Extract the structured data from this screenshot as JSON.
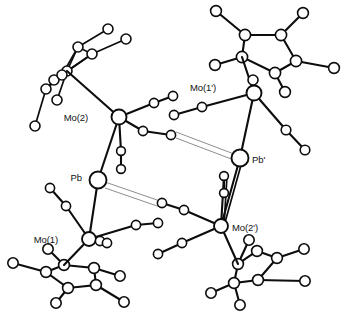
{
  "figure": {
    "kind": "molecular-structure-diagram",
    "style": "ball-and-stick line drawing",
    "background_color": "#ffffff",
    "line_color": "#0d0d0d",
    "rod_color": "#8e8e8e",
    "caption_partial": ""
  },
  "labels": [
    {
      "id": "mo2",
      "text": "Mo(2)",
      "x": 88,
      "y": 118,
      "anchor": "end"
    },
    {
      "id": "mo1prime",
      "text": "Mo(1')",
      "x": 216,
      "y": 88,
      "anchor": "end"
    },
    {
      "id": "pb",
      "text": "Pb",
      "x": 82,
      "y": 178,
      "anchor": "end"
    },
    {
      "id": "pbprime",
      "text": "Pb'",
      "x": 252,
      "y": 160,
      "anchor": "start"
    },
    {
      "id": "mo1",
      "text": "Mo(1)",
      "x": 58,
      "y": 240,
      "anchor": "end"
    },
    {
      "id": "mo2prime",
      "text": "Mo(2')",
      "x": 232,
      "y": 228,
      "anchor": "start"
    }
  ],
  "atoms": {
    "metals": [
      {
        "id": "Mo2",
        "label": "Mo(2)",
        "x": 119,
        "y": 117,
        "r": 7.5
      },
      {
        "id": "Mo1p",
        "label": "Mo(1')",
        "x": 254,
        "y": 93,
        "r": 7.5
      },
      {
        "id": "Pb",
        "label": "Pb",
        "x": 98,
        "y": 180,
        "r": 8.5
      },
      {
        "id": "Pbp",
        "label": "Pb'",
        "x": 240,
        "y": 158,
        "r": 8.5
      },
      {
        "id": "Mo1",
        "label": "Mo(1)",
        "x": 89,
        "y": 239,
        "r": 7.0
      },
      {
        "id": "Mo2p",
        "label": "Mo(2')",
        "x": 221,
        "y": 226,
        "r": 7.0
      }
    ],
    "ligand_atoms": [
      {
        "id": "a01",
        "x": 154,
        "y": 103,
        "r": 4.6
      },
      {
        "id": "a02",
        "x": 173,
        "y": 96,
        "r": 4.6
      },
      {
        "id": "a03",
        "x": 143,
        "y": 131,
        "r": 4.6
      },
      {
        "id": "a04",
        "x": 171,
        "y": 135,
        "r": 4.6
      },
      {
        "id": "a05",
        "x": 121,
        "y": 151,
        "r": 4.4
      },
      {
        "id": "a06",
        "x": 121,
        "y": 169,
        "r": 4.4
      },
      {
        "id": "a07",
        "x": 202,
        "y": 107,
        "r": 4.6
      },
      {
        "id": "a08",
        "x": 174,
        "y": 115,
        "r": 4.6
      },
      {
        "id": "a09",
        "x": 253,
        "y": 80,
        "r": 4.8
      },
      {
        "id": "a10",
        "x": 286,
        "y": 130,
        "r": 4.8
      },
      {
        "id": "a11",
        "x": 305,
        "y": 150,
        "r": 4.8
      },
      {
        "id": "a12",
        "x": 224,
        "y": 176,
        "r": 4.4
      },
      {
        "id": "a13",
        "x": 224,
        "y": 193,
        "r": 4.4
      },
      {
        "id": "a14",
        "x": 162,
        "y": 203,
        "r": 4.6
      },
      {
        "id": "a15",
        "x": 184,
        "y": 210,
        "r": 4.6
      },
      {
        "id": "a16",
        "x": 136,
        "y": 225,
        "r": 4.6
      },
      {
        "id": "a17",
        "x": 158,
        "y": 223,
        "r": 4.6
      },
      {
        "id": "a18",
        "x": 182,
        "y": 243,
        "r": 4.6
      },
      {
        "id": "a19",
        "x": 158,
        "y": 254,
        "r": 4.6
      },
      {
        "id": "a20",
        "x": 50,
        "y": 188,
        "r": 4.6
      },
      {
        "id": "a21",
        "x": 66,
        "y": 206,
        "r": 4.6
      },
      {
        "id": "a22",
        "x": 100,
        "y": 241,
        "r": 4.4
      },
      {
        "id": "a23",
        "x": 107,
        "y": 243,
        "r": 4.4
      },
      {
        "id": "a24",
        "x": 231,
        "y": 222,
        "r": 4.4
      }
    ],
    "ring_top_right": [
      {
        "id": "r1",
        "x": 245,
        "y": 35
      },
      {
        "id": "r2",
        "x": 281,
        "y": 35
      },
      {
        "id": "r3",
        "x": 296,
        "y": 61
      },
      {
        "id": "r4",
        "x": 275,
        "y": 73
      },
      {
        "id": "r5",
        "x": 242,
        "y": 57
      }
    ],
    "ring_top_right_h": [
      {
        "id": "h1",
        "x": 216,
        "y": 11
      },
      {
        "id": "h2",
        "x": 303,
        "y": 13
      },
      {
        "id": "h3",
        "x": 334,
        "y": 68
      },
      {
        "id": "h4",
        "x": 285,
        "y": 92
      },
      {
        "id": "h5",
        "x": 215,
        "y": 65
      }
    ],
    "ring_top_left": [
      {
        "id": "e1",
        "x": 78,
        "y": 47
      },
      {
        "id": "e2",
        "x": 92,
        "y": 54
      },
      {
        "id": "e3",
        "x": 67,
        "y": 71
      },
      {
        "id": "e4",
        "x": 54,
        "y": 80
      },
      {
        "id": "e5",
        "x": 62,
        "y": 75
      }
    ],
    "ring_top_left_h": [
      {
        "id": "g1",
        "x": 126,
        "y": 39
      },
      {
        "id": "g2",
        "x": 108,
        "y": 29
      },
      {
        "id": "g3",
        "x": 46,
        "y": 89
      },
      {
        "id": "g4",
        "x": 35,
        "y": 126
      },
      {
        "id": "g5",
        "x": 57,
        "y": 100
      }
    ],
    "ring_bottom_left": [
      {
        "id": "b1",
        "x": 64,
        "y": 265
      },
      {
        "id": "b2",
        "x": 46,
        "y": 272
      },
      {
        "id": "b3",
        "x": 68,
        "y": 288
      },
      {
        "id": "b4",
        "x": 96,
        "y": 285
      },
      {
        "id": "b5",
        "x": 94,
        "y": 268
      }
    ],
    "ring_bottom_left_h": [
      {
        "id": "k1",
        "x": 48,
        "y": 249
      },
      {
        "id": "k2",
        "x": 13,
        "y": 263
      },
      {
        "id": "k3",
        "x": 56,
        "y": 303
      },
      {
        "id": "k4",
        "x": 124,
        "y": 302
      },
      {
        "id": "k5",
        "x": 120,
        "y": 276
      }
    ],
    "ring_bottom_right": [
      {
        "id": "c1",
        "x": 277,
        "y": 258
      },
      {
        "id": "c2",
        "x": 258,
        "y": 280
      },
      {
        "id": "c3",
        "x": 234,
        "y": 283
      },
      {
        "id": "c4",
        "x": 238,
        "y": 264
      },
      {
        "id": "c5",
        "x": 257,
        "y": 251
      }
    ],
    "ring_bottom_right_h": [
      {
        "id": "m1",
        "x": 304,
        "y": 249
      },
      {
        "id": "m2",
        "x": 305,
        "y": 281
      },
      {
        "id": "m3",
        "x": 240,
        "y": 305
      },
      {
        "id": "m4",
        "x": 211,
        "y": 293
      },
      {
        "id": "m5",
        "x": 249,
        "y": 240
      }
    ]
  }
}
